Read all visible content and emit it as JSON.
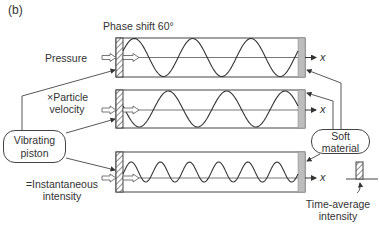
{
  "figure": {
    "panel_label": "(b)",
    "caption_top": "Phase shift 60°",
    "rows": [
      {
        "name": "pressure",
        "label": "Pressure",
        "cycles": 3,
        "axis_label": "x"
      },
      {
        "name": "particle-velocity",
        "label_line1": "×Particle",
        "label_line2": "velocity",
        "cycles": 3,
        "axis_label": "x"
      },
      {
        "name": "instantaneous-intensity",
        "label_line1": "=Instantaneous",
        "label_line2": "intensity",
        "cycles": 6,
        "axis_label": "x"
      }
    ],
    "left_bubble": {
      "line1": "Vibrating",
      "line2": "piston"
    },
    "right_bubble": {
      "line1": "Soft",
      "line2": "material"
    },
    "time_average": {
      "line1": "Time-average",
      "line2": "intensity"
    }
  }
}
